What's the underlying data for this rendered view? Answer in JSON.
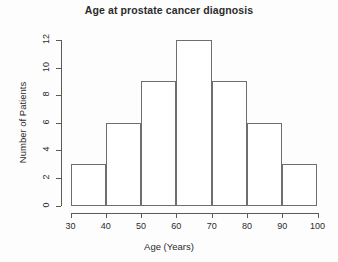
{
  "chart_data": {
    "type": "bar",
    "title": "Age at prostate cancer diagnosis",
    "xlabel": "Age (Years)",
    "ylabel": "Number of Patients",
    "categories": [
      "30-40",
      "40-50",
      "50-60",
      "60-70",
      "70-80",
      "80-90",
      "90-100"
    ],
    "bin_edges": [
      30,
      40,
      50,
      60,
      70,
      80,
      90,
      100
    ],
    "values": [
      3,
      6,
      9,
      12,
      9,
      6,
      3
    ],
    "xlim": [
      30,
      100
    ],
    "ylim": [
      0,
      12
    ],
    "xticks": [
      30,
      40,
      50,
      60,
      70,
      80,
      90,
      100
    ],
    "yticks": [
      0,
      2,
      4,
      6,
      8,
      10,
      12
    ],
    "xtick_labels": [
      "30",
      "40",
      "50",
      "60",
      "70",
      "80",
      "90",
      "100"
    ],
    "ytick_labels": [
      "0",
      "2",
      "4",
      "6",
      "8",
      "10",
      "12"
    ],
    "grid": false,
    "legend": false,
    "bar_fill": "#ffffff",
    "bar_edge_color": "#6e6e6e",
    "axis_color": "#5a5a5a",
    "text_color": "#2b2b2b",
    "background": "#fdfdfd"
  }
}
